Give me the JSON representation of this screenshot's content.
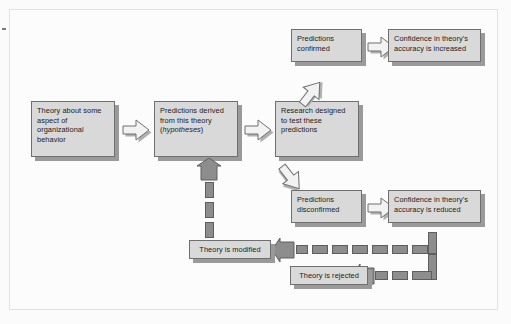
{
  "diagram": {
    "colors": {
      "box_fill": "#d9d9d9",
      "box_border": "#6f6f6f",
      "box_shadow": "#9a9a9a",
      "arrow_outline": "#6f6f6f",
      "arrow_fill": "#f2f2f2",
      "feedback_fill": "#8d8d8d",
      "feedback_border": "#5e5e5e",
      "frame_border": "#e2e2e2",
      "page_background": "#fbfbfb"
    },
    "nodes": [
      {
        "id": "theory",
        "label": "Theory about some aspect of organizational behavior"
      },
      {
        "id": "predictions",
        "label_part1": "Predictions derived from this theory (",
        "label_italic": "hypotheses",
        "label_part2": ")"
      },
      {
        "id": "research",
        "label": "Research designed to test these predictions"
      },
      {
        "id": "confirmed",
        "label": "Predictions confirmed"
      },
      {
        "id": "increased",
        "label": "Confidence in theory's accuracy is increased"
      },
      {
        "id": "disconfirmed",
        "label": "Predictions disconfirmed"
      },
      {
        "id": "reduced",
        "label": "Confidence in theory's accuracy is reduced"
      },
      {
        "id": "modified",
        "label": "Theory is modified"
      },
      {
        "id": "rejected",
        "label": "Theory is rejected"
      }
    ],
    "edges": [
      {
        "from": "theory",
        "to": "predictions",
        "style": "hollow-arrow",
        "direction": "right"
      },
      {
        "from": "predictions",
        "to": "research",
        "style": "hollow-arrow",
        "direction": "right"
      },
      {
        "from": "research",
        "to": "confirmed",
        "style": "hollow-arrow",
        "direction": "up-right"
      },
      {
        "from": "confirmed",
        "to": "increased",
        "style": "hollow-arrow",
        "direction": "right"
      },
      {
        "from": "research",
        "to": "disconfirmed",
        "style": "hollow-arrow",
        "direction": "down-right"
      },
      {
        "from": "disconfirmed",
        "to": "reduced",
        "style": "hollow-arrow",
        "direction": "right"
      },
      {
        "from": "reduced",
        "to": "modified",
        "style": "dashed-arrow",
        "direction": "left"
      },
      {
        "from": "reduced",
        "to": "rejected",
        "style": "dashed-arrow",
        "direction": "left"
      },
      {
        "from": "modified",
        "to": "predictions",
        "style": "dashed-arrow",
        "direction": "up"
      }
    ]
  }
}
